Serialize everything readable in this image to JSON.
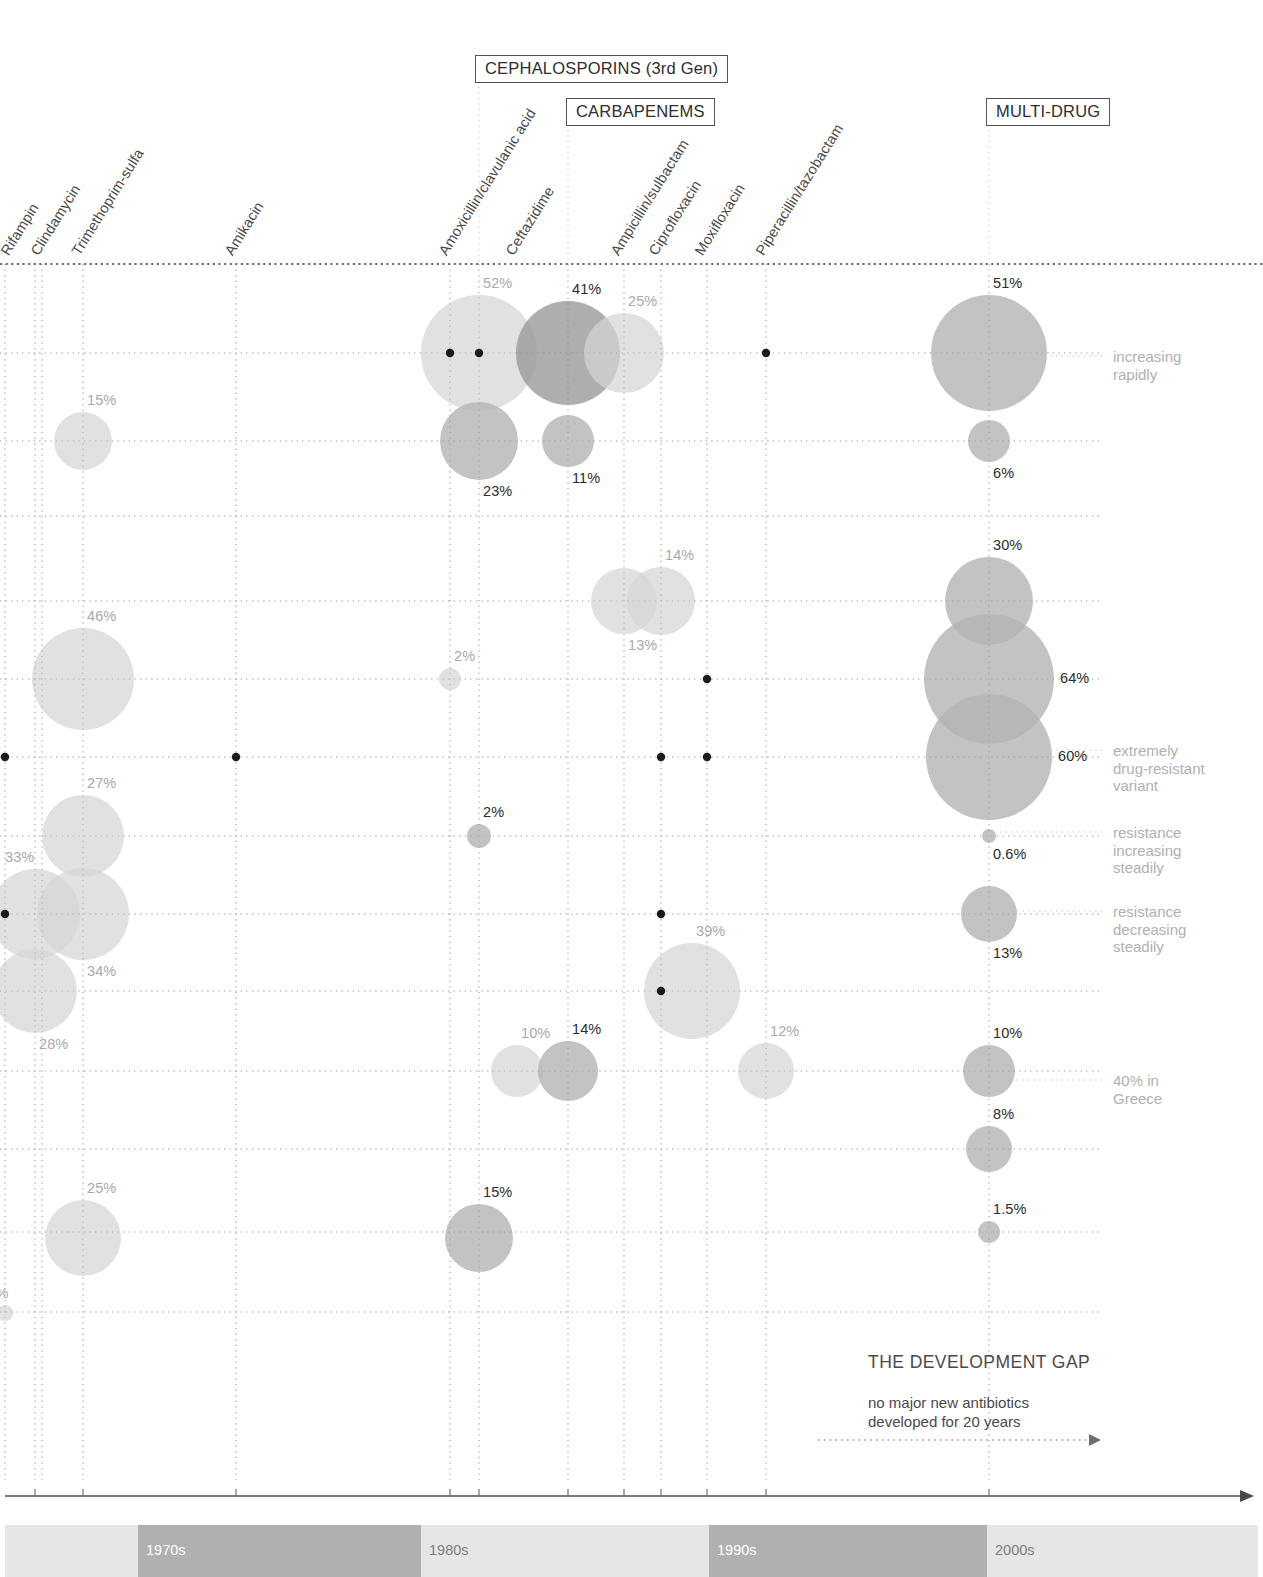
{
  "meta": {
    "width": 1263,
    "height": 1577,
    "background": "#ffffff"
  },
  "chart_data": {
    "type": "scatter",
    "xlabel": "",
    "ylabel": "",
    "grid": true,
    "legend_position": "right",
    "x_axis_kind": "timeline of antibiotic introduction (decades)",
    "x_categories": [
      "Rifampin",
      "Clindamycin",
      "Trimethoprim-sulfa",
      "Amikacin",
      "Amoxicillin/clavulanic acid",
      "Ceftazidime",
      "Ampicillin/sulbactam",
      "Ciprofloxacin",
      "Moxifloxacin",
      "Piperacillin/tazobactam",
      "MULTI-DRUG"
    ],
    "class_groups": [
      {
        "label": "CEPHALOSPORINS (3rd Gen)"
      },
      {
        "label": "CARBAPENEMS"
      },
      {
        "label": "MULTI-DRUG"
      }
    ],
    "decades": [
      "1970s",
      "1980s",
      "1990s",
      "2000s"
    ],
    "bubbles": [
      {
        "label": "15%",
        "value": 15,
        "x": 83,
        "y": 441,
        "r": 29,
        "tone": "light",
        "label_pos": "top"
      },
      {
        "label": "46%",
        "value": 46,
        "x": 83,
        "y": 679,
        "r": 51,
        "tone": "light",
        "label_pos": "top"
      },
      {
        "label": "27%",
        "value": 27,
        "x": 83,
        "y": 836,
        "r": 41,
        "tone": "light",
        "label_pos": "top"
      },
      {
        "label": "33%",
        "value": 33,
        "x": 35,
        "y": 914,
        "r": 45,
        "tone": "light",
        "label_pos": "topleft"
      },
      {
        "label": "34%",
        "value": 34,
        "x": 83,
        "y": 914,
        "r": 46,
        "tone": "light",
        "label_pos": "bottom"
      },
      {
        "label": "28%",
        "value": 28,
        "x": 35,
        "y": 991,
        "r": 42,
        "tone": "light",
        "label_pos": "bottom"
      },
      {
        "label": "25%",
        "value": 25,
        "x": 83,
        "y": 1238,
        "r": 38,
        "tone": "light",
        "label_pos": "top"
      },
      {
        "label": "0.8%",
        "value": 0.8,
        "x": 5,
        "y": 1313,
        "r": 8,
        "tone": "light",
        "label_pos": "topleft"
      },
      {
        "label": "52%",
        "value": 52,
        "x": 479,
        "y": 353,
        "r": 58,
        "tone": "light",
        "label_pos": "top"
      },
      {
        "label": "41%",
        "value": 41,
        "x": 568,
        "y": 353,
        "r": 52,
        "tone": "dark",
        "label_pos": "top"
      },
      {
        "label": "25%",
        "value": 25,
        "x": 624,
        "y": 353,
        "r": 40,
        "tone": "light",
        "label_pos": "top"
      },
      {
        "label": "23%",
        "value": 23,
        "x": 479,
        "y": 441,
        "r": 39,
        "tone": "mid",
        "label_pos": "bottom"
      },
      {
        "label": "11%",
        "value": 11,
        "x": 568,
        "y": 441,
        "r": 26,
        "tone": "mid",
        "label_pos": "bottom"
      },
      {
        "label": "13%",
        "value": 13,
        "x": 624,
        "y": 601,
        "r": 33,
        "tone": "light",
        "label_pos": "bottom"
      },
      {
        "label": "14%",
        "value": 14,
        "x": 661,
        "y": 601,
        "r": 34,
        "tone": "light",
        "label_pos": "top"
      },
      {
        "label": "2%",
        "value": 2,
        "x": 450,
        "y": 679,
        "r": 11,
        "tone": "light",
        "label_pos": "top"
      },
      {
        "label": "2%",
        "value": 2,
        "x": 479,
        "y": 836,
        "r": 12,
        "tone": "mid",
        "label_pos": "top"
      },
      {
        "label": "39%",
        "value": 39,
        "x": 692,
        "y": 991,
        "r": 48,
        "tone": "light",
        "label_pos": "top"
      },
      {
        "label": "10%",
        "value": 10,
        "x": 517,
        "y": 1071,
        "r": 26,
        "tone": "light",
        "label_pos": "top"
      },
      {
        "label": "14%",
        "value": 14,
        "x": 568,
        "y": 1071,
        "r": 30,
        "tone": "mid",
        "label_pos": "top"
      },
      {
        "label": "12%",
        "value": 12,
        "x": 766,
        "y": 1071,
        "r": 28,
        "tone": "light",
        "label_pos": "top"
      },
      {
        "label": "15%",
        "value": 15,
        "x": 479,
        "y": 1238,
        "r": 34,
        "tone": "mid",
        "label_pos": "top"
      },
      {
        "label": "51%",
        "value": 51,
        "x": 989,
        "y": 353,
        "r": 58,
        "tone": "mid",
        "label_pos": "top"
      },
      {
        "label": "6%",
        "value": 6,
        "x": 989,
        "y": 441,
        "r": 21,
        "tone": "mid",
        "label_pos": "bottom"
      },
      {
        "label": "30%",
        "value": 30,
        "x": 989,
        "y": 601,
        "r": 44,
        "tone": "mid",
        "label_pos": "top"
      },
      {
        "label": "64%",
        "value": 64,
        "x": 989,
        "y": 679,
        "r": 65,
        "tone": "mid",
        "label_pos": "right"
      },
      {
        "label": "60%",
        "value": 60,
        "x": 989,
        "y": 757,
        "r": 63,
        "tone": "mid",
        "label_pos": "right"
      },
      {
        "label": "0.6%",
        "value": 0.6,
        "x": 989,
        "y": 836,
        "r": 7,
        "tone": "mid",
        "label_pos": "bottom"
      },
      {
        "label": "13%",
        "value": 13,
        "x": 989,
        "y": 914,
        "r": 28,
        "tone": "mid",
        "label_pos": "bottom"
      },
      {
        "label": "10%",
        "value": 10,
        "x": 989,
        "y": 1071,
        "r": 26,
        "tone": "mid",
        "label_pos": "top"
      },
      {
        "label": "8%",
        "value": 8,
        "x": 989,
        "y": 1149,
        "r": 23,
        "tone": "mid",
        "label_pos": "top"
      },
      {
        "label": "1.5%",
        "value": 1.5,
        "x": 989,
        "y": 1232,
        "r": 11,
        "tone": "mid",
        "label_pos": "top"
      }
    ],
    "annotations": [
      {
        "text": "increasing\nrapidly",
        "x": 1113,
        "y": 348
      },
      {
        "text": "extremely\ndrug-resistant\nvariant",
        "x": 1113,
        "y": 742
      },
      {
        "text": "resistance\nincreasing\nsteadily",
        "x": 1113,
        "y": 824
      },
      {
        "text": "resistance\ndecreasing\nsteadily",
        "x": 1113,
        "y": 903
      },
      {
        "text": "40% in\nGreece",
        "x": 1113,
        "y": 1072
      }
    ]
  },
  "drug_labels": [
    {
      "text": "Rifampin",
      "x": 11,
      "y": 256
    },
    {
      "text": "Clindamycin",
      "x": 41,
      "y": 256
    },
    {
      "text": "Trimethoprim-sulfa",
      "x": 82,
      "y": 256
    },
    {
      "text": "Amikacin",
      "x": 235,
      "y": 256
    },
    {
      "text": "Amoxicillin/clavulanic acid",
      "x": 449,
      "y": 256
    },
    {
      "text": "Ceftazidime",
      "x": 516,
      "y": 256
    },
    {
      "text": "Ampicillin/sulbactam",
      "x": 621,
      "y": 256
    },
    {
      "text": "Ciprofloxacin",
      "x": 659,
      "y": 256
    },
    {
      "text": "Moxifloxacin",
      "x": 705,
      "y": 256
    },
    {
      "text": "Piperacillin/tazobactam",
      "x": 766,
      "y": 256
    }
  ],
  "class_boxes": [
    {
      "label": "CEPHALOSPORINS (3rd Gen)",
      "x": 475,
      "y": 55,
      "tick_x": 479
    },
    {
      "label": "CARBAPENEMS",
      "x": 566,
      "y": 98,
      "tick_x": 568
    },
    {
      "label": "MULTI-DRUG",
      "x": 986,
      "y": 98,
      "tick_x": 989
    }
  ],
  "development_gap": {
    "title": "THE DEVELOPMENT GAP",
    "subtitle": "no major new antibiotics\ndeveloped for 20 years",
    "arrow_from_x": 818,
    "arrow_to_x": 1100,
    "arrow_y": 1440
  },
  "decade_band": {
    "left": 5,
    "right": 1258,
    "segments": [
      {
        "label": "1970s",
        "x": 5,
        "w": 133,
        "shade": "#e6e6e6",
        "text_tone": "on-light",
        "label_visible": false
      },
      {
        "label": "1970s",
        "x": 138,
        "w": 283,
        "shade": "#b0b0b0",
        "text_tone": "on-dark",
        "label_visible": true
      },
      {
        "label": "1980s",
        "x": 421,
        "w": 288,
        "shade": "#e6e6e6",
        "text_tone": "on-light",
        "label_visible": true
      },
      {
        "label": "1990s",
        "x": 709,
        "w": 278,
        "shade": "#b0b0b0",
        "text_tone": "on-dark",
        "label_visible": true
      },
      {
        "label": "2000s",
        "x": 987,
        "w": 271,
        "shade": "#e6e6e6",
        "text_tone": "on-light",
        "label_visible": true
      }
    ]
  },
  "grid": {
    "v_lines": [
      5,
      35,
      42,
      83,
      236,
      450,
      479,
      568,
      624,
      661,
      707,
      766,
      989
    ],
    "h_lines": [
      264,
      353,
      441,
      516,
      601,
      679,
      757,
      836,
      914,
      991,
      1071,
      1149,
      1232,
      1312
    ],
    "top_rule_y": 264,
    "plot_left": 0,
    "plot_right": 1100,
    "grid_color": "#c9c9c9",
    "top_rule_color": "#6f6f6f"
  },
  "timeline_axis": {
    "y": 1496,
    "x_start": 5,
    "x_end": 1252,
    "tick_xs": [
      35,
      83,
      236,
      450,
      479,
      568,
      624,
      661,
      707,
      766,
      989
    ]
  },
  "colors": {
    "bubble_light": "#d6d6d6",
    "bubble_mid": "#b4b4b4",
    "bubble_dark": "#9a9a9a",
    "marker_dot": "#1a1a1a",
    "accent_text": "#4a4a4a",
    "note_text": "#b0b0b0"
  },
  "marker_dots": [
    {
      "x": 450,
      "y": 353
    },
    {
      "x": 479,
      "y": 353
    },
    {
      "x": 766,
      "y": 353
    },
    {
      "x": 5,
      "y": 757
    },
    {
      "x": 236,
      "y": 757
    },
    {
      "x": 661,
      "y": 757
    },
    {
      "x": 707,
      "y": 757
    },
    {
      "x": 5,
      "y": 914
    },
    {
      "x": 661,
      "y": 914
    },
    {
      "x": 661,
      "y": 991
    },
    {
      "x": 707,
      "y": 679
    }
  ]
}
